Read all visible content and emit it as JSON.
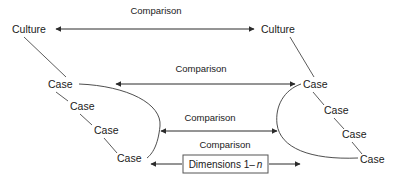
{
  "diagram": {
    "nodes": {
      "culture_left": "Culture",
      "culture_right": "Culture",
      "left_cases": [
        "Case",
        "Case",
        "Case",
        "Case"
      ],
      "right_cases": [
        "Case",
        "Case",
        "Case",
        "Case"
      ]
    },
    "edges": [
      {
        "id": "comparison-cultures",
        "label": "Comparison"
      },
      {
        "id": "comparison-cases-1",
        "label": "Comparison"
      },
      {
        "id": "comparison-cases-2",
        "label": "Comparison"
      },
      {
        "id": "comparison-cases-3",
        "label": "Comparison"
      }
    ],
    "dimensions_box": {
      "prefix": "Dimensions 1– ",
      "variable": "n"
    },
    "colors": {
      "background": "#ffffff",
      "stroke": "#2b2b2b",
      "curve": "#3a3a3a",
      "text": "#1a1a1a",
      "box_border": "#555555"
    }
  }
}
